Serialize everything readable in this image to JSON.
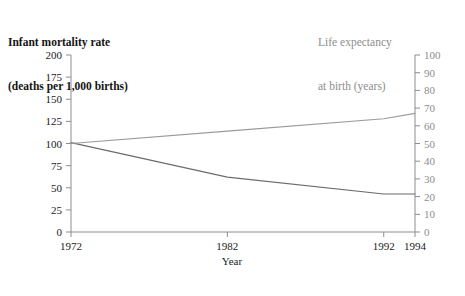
{
  "titles": {
    "left_line1": "Infant mortality rate",
    "left_line2": "(deaths per 1,000 births)",
    "right_line1": "Life expectancy",
    "right_line2": "at birth (years)"
  },
  "colors": {
    "text": "#1a1a1a",
    "muted": "#8d8d8d",
    "line_mortality": "#6b6b6b",
    "line_life": "#9a9a9a",
    "axis": "#8d8d8d",
    "background": "#ffffff"
  },
  "chart_data": {
    "type": "line",
    "xlabel": "Year",
    "x": [
      1972,
      1982,
      1992,
      1994
    ],
    "xtick_labels": [
      "1972",
      "1982",
      "1992",
      "1994"
    ],
    "grid": false,
    "legend": "none",
    "axes": [
      {
        "id": "left",
        "position": "left",
        "label": "Infant mortality rate (deaths per 1,000 births)",
        "ylim": [
          0,
          200
        ],
        "ytick_values": [
          0,
          25,
          50,
          75,
          100,
          125,
          150,
          175,
          200
        ],
        "ytick_labels": [
          "0",
          "25",
          "50",
          "75",
          "100",
          "125",
          "150",
          "175",
          "200"
        ]
      },
      {
        "id": "right",
        "position": "right",
        "label": "Life expectancy at birth (years)",
        "ylim": [
          0,
          100
        ],
        "ytick_values": [
          0,
          10,
          20,
          30,
          40,
          50,
          60,
          70,
          80,
          90,
          100
        ],
        "ytick_labels": [
          "0",
          "10",
          "20",
          "30",
          "40",
          "50",
          "60",
          "70",
          "80",
          "90",
          "100"
        ]
      }
    ],
    "series": [
      {
        "name": "Infant mortality rate",
        "axis": "left",
        "units": "deaths per 1,000 births",
        "values": [
          101,
          62,
          43,
          43
        ]
      },
      {
        "name": "Life expectancy at birth",
        "axis": "right",
        "units": "years",
        "values": [
          50,
          57,
          64,
          67
        ]
      }
    ]
  }
}
